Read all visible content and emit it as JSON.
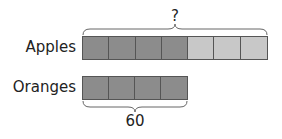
{
  "diagram": {
    "type": "bar-model",
    "rows": [
      {
        "label": "Apples",
        "units": 7,
        "shaded_units": 4,
        "top_label": "?"
      },
      {
        "label": "Oranges",
        "units": 4,
        "shaded_units": 4,
        "bottom_label": "60"
      }
    ],
    "colors": {
      "dark": "#8c8c8c",
      "light": "#c8c8c8",
      "border": "#555555"
    }
  }
}
